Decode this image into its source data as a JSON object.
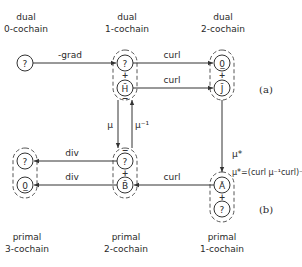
{
  "column_labels": {
    "dual_0": {
      "line1": "dual",
      "line2": "0-cochain"
    },
    "dual_1": {
      "line1": "dual",
      "line2": "1-cochain"
    },
    "dual_2": {
      "line1": "dual",
      "line2": "2-cochain"
    },
    "primal_3": {
      "line1": "primal",
      "line2": "3-cochain"
    },
    "primal_2": {
      "line1": "primal",
      "line2": "2-cochain"
    },
    "primal_1": {
      "line1": "primal",
      "line2": "1-cochain"
    }
  },
  "nodes": {
    "dual0": "?",
    "dual1_top": "?",
    "dual1_bottom": "H̄",
    "dual2_top": "0̲",
    "dual2_bottom": "J̄",
    "primal3_top": "?",
    "primal3_bottom": "0̲",
    "primal2_top": "?",
    "primal2_bottom": "B̄",
    "primal1_top": "Ā",
    "primal1_bottom": "?"
  },
  "edges": {
    "grad": "-grad",
    "curl_top": "curl",
    "curl_mid": "curl",
    "div_top": "div",
    "div_bottom": "div",
    "curl_bottom": "curl",
    "mu": "μ",
    "mu_inv": "μ⁻¹",
    "mu_star": "μ*",
    "mu_star_def": "μ*=(curl μ⁻¹curl)⁻¹"
  },
  "signs": {
    "plus": "+",
    "minus": "−"
  },
  "tags": {
    "a": "(a)",
    "b": "(b)"
  }
}
